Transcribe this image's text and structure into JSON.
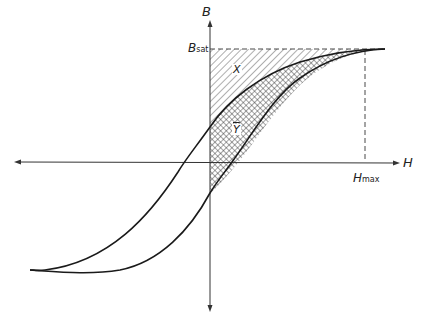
{
  "diagram": {
    "axes": {
      "vertical_label": "B",
      "horizontal_label": "H"
    },
    "markers": {
      "b_sat": {
        "main": "B",
        "sub": "sat"
      },
      "h_max": {
        "main": "H",
        "sub": "max"
      }
    },
    "regions": {
      "x_label": "X",
      "y_label": "Y"
    },
    "colors": {
      "line": "#1a1a1a",
      "hatch": "#333333",
      "background": "#ffffff"
    }
  }
}
